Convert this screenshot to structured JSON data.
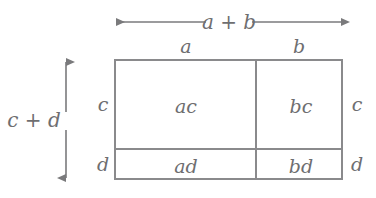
{
  "diagram": {
    "type": "area-model",
    "identity": "(a + b)(c + d) = ac + bc + ad + bd",
    "colors": {
      "background": "#ffffff",
      "line": "#8a8a8c",
      "text": "#6e6e70",
      "arrow": "#7a7a7c"
    },
    "top_dimension": {
      "label": "a + b",
      "arrow": "double-headed-horizontal"
    },
    "left_dimension": {
      "label": "c + d",
      "arrow": "double-headed-vertical"
    },
    "column_labels": [
      {
        "name": "col-a",
        "label": "a"
      },
      {
        "name": "col-b",
        "label": "b"
      }
    ],
    "row_labels_left": [
      {
        "name": "row-c-left",
        "label": "c"
      },
      {
        "name": "row-d-left",
        "label": "d"
      }
    ],
    "row_labels_right": [
      {
        "name": "row-c-right",
        "label": "c"
      },
      {
        "name": "row-d-right",
        "label": "d"
      }
    ],
    "cells": [
      {
        "name": "cell-ac",
        "label": "ac",
        "row": "c",
        "col": "a"
      },
      {
        "name": "cell-bc",
        "label": "bc",
        "row": "c",
        "col": "b"
      },
      {
        "name": "cell-ad",
        "label": "ad",
        "row": "d",
        "col": "a"
      },
      {
        "name": "cell-bd",
        "label": "bd",
        "row": "d",
        "col": "b"
      }
    ]
  }
}
